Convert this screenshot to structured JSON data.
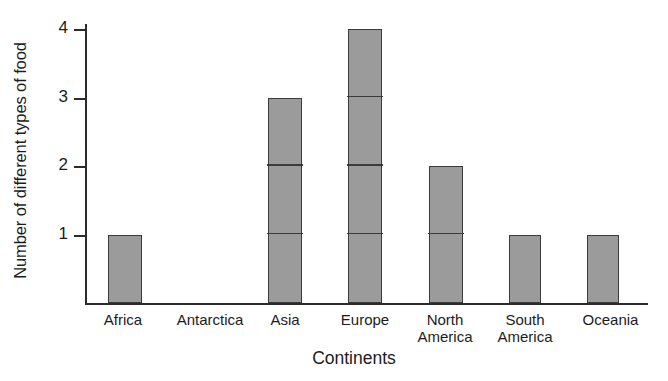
{
  "chart_data": {
    "type": "bar",
    "title": "",
    "xlabel": "Continents",
    "ylabel": "Number of different types of food",
    "categories": [
      "Africa",
      "Antarctica",
      "Asia",
      "Europe",
      "North\nAmerica",
      "South\nAmerica",
      "Oceania"
    ],
    "values": [
      1,
      0,
      3,
      4,
      2,
      1,
      1
    ],
    "ylim": [
      0,
      4
    ],
    "yticks": [
      1,
      2,
      3,
      4
    ],
    "ytick_labels": [
      "1",
      "2",
      "3",
      "4"
    ],
    "grid": false,
    "legend": null,
    "bar_style": {
      "fill": "#9b9b9b",
      "edge": "#3b3b3b",
      "segmented_unit_lines": true
    },
    "axis_color": "#2b2b2b",
    "background": "#ffffff"
  },
  "axes": {
    "y_title": "Number of different types of food",
    "x_title": "Continents"
  },
  "bars": [
    {
      "label": "Africa",
      "value": 1,
      "left": 23,
      "width": 34
    },
    {
      "label": "Antarctica",
      "value": 0,
      "left": 110,
      "width": 34
    },
    {
      "label": "Asia",
      "value": 3,
      "left": 183,
      "width": 34
    },
    {
      "label": "Europe",
      "value": 4,
      "left": 263,
      "width": 34
    },
    {
      "label": "North\nAmerica",
      "value": 2,
      "left": 344,
      "width": 34
    },
    {
      "label": "South\nAmerica",
      "value": 1,
      "left": 424,
      "width": 32
    },
    {
      "label": "Oceania",
      "value": 1,
      "left": 502,
      "width": 32
    }
  ],
  "cat_label_positions": [
    {
      "left": 78,
      "width": 90
    },
    {
      "left": 155,
      "width": 110
    },
    {
      "left": 240,
      "width": 90
    },
    {
      "left": 320,
      "width": 90
    },
    {
      "left": 400,
      "width": 90
    },
    {
      "left": 480,
      "width": 90
    },
    {
      "left": 563,
      "width": 95
    }
  ]
}
